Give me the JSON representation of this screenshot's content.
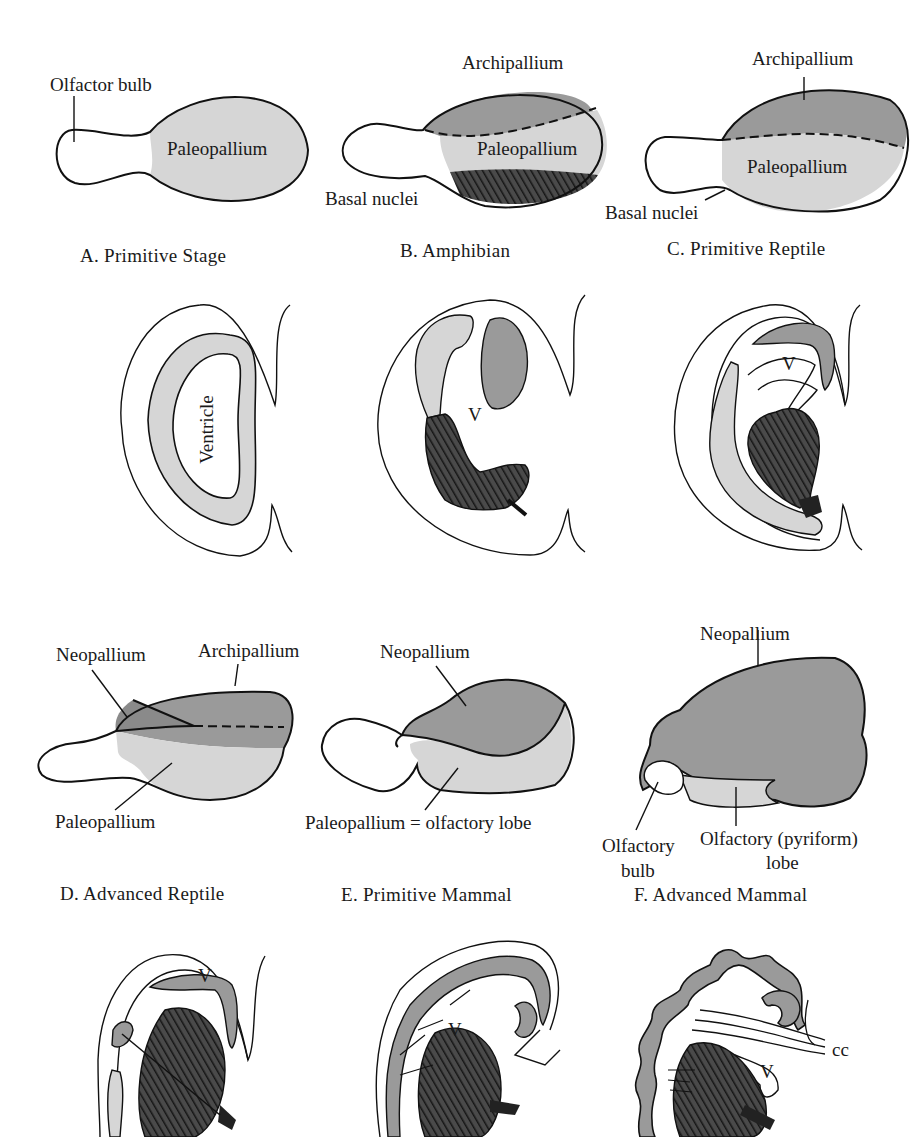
{
  "figure": {
    "colors": {
      "paleopallium": "#d6d6d6",
      "archipallium": "#9a9a9a",
      "neopallium": "#9a9a9a",
      "basal_nuclei": "#3a3a3a",
      "outline": "#111111",
      "background": "#ffffff"
    },
    "panels": [
      {
        "id": "A",
        "caption": "A.  Primitive Stage",
        "lateral_labels": [
          "Olfactor bulb",
          "Paleopallium"
        ],
        "section_labels": [
          "Ventricle"
        ]
      },
      {
        "id": "B",
        "caption": "B.  Amphibian",
        "lateral_labels": [
          "Archipallium",
          "Paleopallium",
          "Basal nuclei"
        ],
        "section_labels": [
          "V"
        ]
      },
      {
        "id": "C",
        "caption": "C.  Primitive Reptile",
        "lateral_labels": [
          "Archipallium",
          "Paleopallium",
          "Basal nuclei"
        ],
        "section_labels": [
          "V"
        ]
      },
      {
        "id": "D",
        "caption": "D.  Advanced Reptile",
        "lateral_labels": [
          "Neopallium",
          "Archipallium",
          "Paleopallium"
        ],
        "section_labels": [
          "V"
        ]
      },
      {
        "id": "E",
        "caption": "E.  Primitive Mammal",
        "lateral_labels": [
          "Neopallium",
          "Paleopallium = olfactory lobe"
        ],
        "section_labels": [
          "V"
        ]
      },
      {
        "id": "F",
        "caption": "F.  Advanced Mammal",
        "lateral_labels": [
          "Neopallium",
          "Olfactory",
          "bulb",
          "Olfactory (pyriform)",
          "lobe"
        ],
        "section_labels": [
          "V",
          "cc"
        ]
      }
    ]
  }
}
